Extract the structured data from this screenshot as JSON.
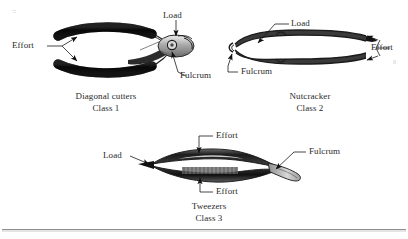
{
  "figure": {
    "title_visible": false,
    "background_color": "#ffffff",
    "ink_color": "#1b1b1b",
    "bottom_rule": true
  },
  "levers": [
    {
      "id": "class-1",
      "tool_name": "Diagonal cutters",
      "class_label": "Class 1",
      "annotations": [
        {
          "name": "effort",
          "text": "Effort"
        },
        {
          "name": "load",
          "text": "Load"
        },
        {
          "name": "fulcrum",
          "text": "Fulcrum"
        }
      ]
    },
    {
      "id": "class-2",
      "tool_name": "Nutcracker",
      "class_label": "Class 2",
      "annotations": [
        {
          "name": "load",
          "text": "Load"
        },
        {
          "name": "fulcrum",
          "text": "Fulcrum"
        },
        {
          "name": "effort",
          "text": "Effort"
        }
      ]
    },
    {
      "id": "class-3",
      "tool_name": "Tweezers",
      "class_label": "Class 3",
      "annotations": [
        {
          "name": "effort-top",
          "text": "Effort"
        },
        {
          "name": "load",
          "text": "Load"
        },
        {
          "name": "fulcrum",
          "text": "Fulcrum"
        },
        {
          "name": "effort-bottom",
          "text": "Effort"
        }
      ]
    }
  ]
}
